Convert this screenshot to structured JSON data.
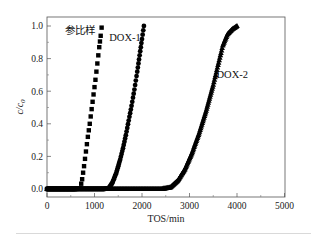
{
  "chart_data": {
    "type": "scatter",
    "title": "",
    "xlabel": "TOS/min",
    "ylabel": "c/c0",
    "xlim": [
      0,
      5000
    ],
    "ylim": [
      -0.05,
      1.05
    ],
    "x_ticks": [
      0,
      1000,
      2000,
      3000,
      4000,
      5000
    ],
    "x_tick_labels": [
      "0",
      "1000",
      "2000",
      "3000",
      "4000",
      "5000"
    ],
    "y_ticks": [
      0.0,
      0.2,
      0.4,
      0.6,
      0.8,
      1.0
    ],
    "y_tick_labels": [
      "0.0",
      "0.2",
      "0.4",
      "0.6",
      "0.8",
      "1.0"
    ],
    "grid": false,
    "legend": "inline annotations",
    "series": [
      {
        "name": "参比样",
        "marker": "square",
        "x": [
          0,
          100,
          200,
          300,
          400,
          500,
          600,
          700,
          740,
          780,
          820,
          860,
          900,
          940,
          980,
          1020,
          1060,
          1100,
          1130,
          1150
        ],
        "y": [
          0,
          0,
          0,
          0,
          0,
          0,
          0,
          0.005,
          0.06,
          0.14,
          0.23,
          0.32,
          0.4,
          0.49,
          0.58,
          0.67,
          0.77,
          0.87,
          0.94,
          0.99
        ]
      },
      {
        "name": "DOX-1",
        "marker": "circle",
        "x": [
          0,
          200,
          400,
          600,
          800,
          1000,
          1200,
          1300,
          1380,
          1460,
          1540,
          1600,
          1660,
          1720,
          1780,
          1840,
          1900,
          1950,
          2000,
          2040
        ],
        "y": [
          0,
          0,
          0,
          0,
          0,
          0,
          0,
          0.005,
          0.04,
          0.1,
          0.18,
          0.25,
          0.33,
          0.42,
          0.51,
          0.61,
          0.72,
          0.82,
          0.92,
          1.0
        ]
      },
      {
        "name": "DOX-2",
        "marker": "triangle",
        "x": [
          0,
          400,
          800,
          1200,
          1600,
          2000,
          2400,
          2600,
          2750,
          2900,
          3050,
          3200,
          3350,
          3500,
          3600,
          3700,
          3800,
          3900,
          4000
        ],
        "y": [
          0,
          0,
          0,
          0,
          0,
          0,
          0,
          0.01,
          0.05,
          0.12,
          0.22,
          0.34,
          0.48,
          0.64,
          0.76,
          0.88,
          0.95,
          0.98,
          1.0
        ]
      }
    ],
    "annotations": [
      {
        "text": "参比样",
        "x": 380,
        "y": 0.95
      },
      {
        "text": "DOX-1",
        "x": 1310,
        "y": 0.91
      },
      {
        "text": "DOX-2",
        "x": 3900,
        "y": 0.68
      }
    ]
  }
}
